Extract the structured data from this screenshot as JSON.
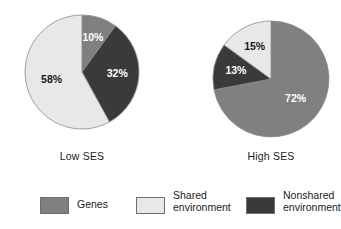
{
  "figure": {
    "background": "#ffffff"
  },
  "chart_data": [
    {
      "type": "pie",
      "title": "Low SES",
      "caption": "Low SES",
      "start_angle_deg": 0,
      "direction": "clockwise",
      "categories": [
        "Genes",
        "Shared environment",
        "Nonshared environment"
      ],
      "labels": [
        "10%",
        "32%",
        "58%"
      ],
      "slices": [
        {
          "name": "Genes",
          "value": 10,
          "label": "10%",
          "color": "#808080",
          "label_color": "#ffffff"
        },
        {
          "name": "Nonshared environment",
          "value": 32,
          "label": "32%",
          "color": "#3a3a3a",
          "label_color": "#ffffff"
        },
        {
          "name": "Shared environment",
          "value": 58,
          "label": "58%",
          "color": "#e8e8e8",
          "label_color": "#1a1a1a"
        }
      ]
    },
    {
      "type": "pie",
      "title": "High SES",
      "caption": "High SES",
      "start_angle_deg": 0,
      "direction": "clockwise",
      "categories": [
        "Genes",
        "Shared environment",
        "Nonshared environment"
      ],
      "labels": [
        "72%",
        "13%",
        "15%"
      ],
      "slices": [
        {
          "name": "Genes",
          "value": 72,
          "label": "72%",
          "color": "#808080",
          "label_color": "#ffffff"
        },
        {
          "name": "Nonshared environment",
          "value": 13,
          "label": "13%",
          "color": "#3a3a3a",
          "label_color": "#ffffff"
        },
        {
          "name": "Shared environment",
          "value": 15,
          "label": "15%",
          "color": "#e8e8e8",
          "label_color": "#1a1a1a"
        }
      ]
    }
  ],
  "legend": {
    "position": "bottom",
    "items": [
      {
        "label": "Genes",
        "color": "#808080"
      },
      {
        "label": "Shared\nenvironment",
        "color": "#e8e8e8"
      },
      {
        "label": "Nonshared\nenvironment",
        "color": "#3a3a3a"
      }
    ]
  }
}
